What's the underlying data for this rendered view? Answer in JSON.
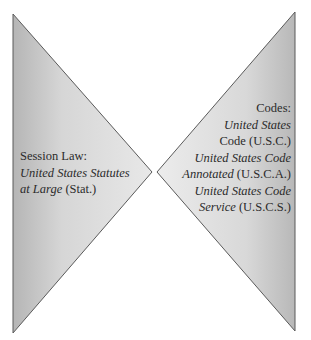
{
  "diagram": {
    "colors": {
      "background": "#ffffff",
      "fill_light": "#e4e4e4",
      "fill_dark": "#b9b9b9",
      "stroke": "#5a5a5a",
      "text": "#2b2b2b"
    },
    "left_shape": {
      "type": "triangle-pointing-right",
      "points": [
        [
          13,
          14
        ],
        [
          152,
          172
        ],
        [
          13,
          333
        ]
      ]
    },
    "right_shape": {
      "type": "triangle-pointing-left",
      "points": [
        [
          295,
          12
        ],
        [
          157,
          172
        ],
        [
          295,
          331
        ]
      ]
    },
    "left_label": {
      "heading": "Session Law:",
      "title_line1": "United States Statutes",
      "title_line2": "at Large",
      "abbrev": "(Stat.)"
    },
    "right_label": {
      "heading": "Codes:",
      "items": [
        {
          "title_line1": "United States",
          "title_line2": "Code",
          "abbrev": "(U.S.C.)"
        },
        {
          "title_line1": "United States Code",
          "title_line2": "Annotated",
          "abbrev": "(U.S.C.A.)"
        },
        {
          "title_line1": "United States Code",
          "title_line2": "Service",
          "abbrev": "(U.S.C.S.)"
        }
      ]
    }
  }
}
